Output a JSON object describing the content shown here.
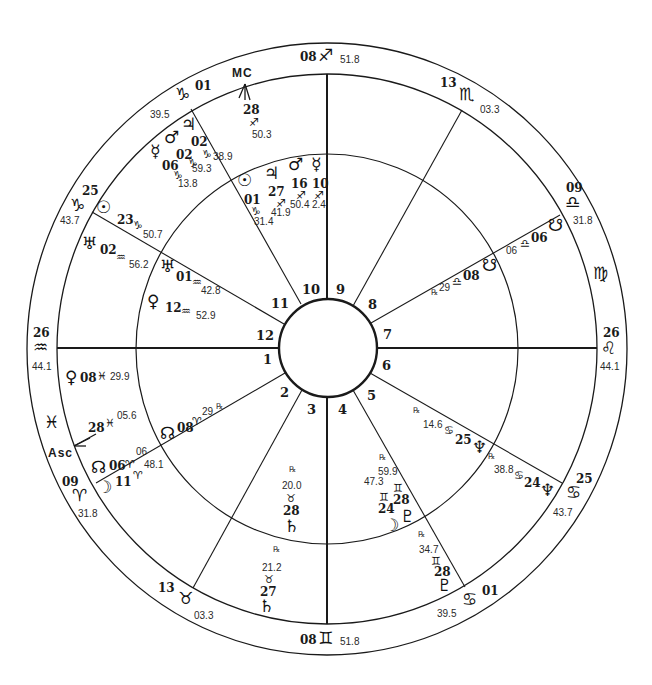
{
  "chart": {
    "type": "natal-astrology-wheel",
    "colors": {
      "ink": "#1a1a1a",
      "background": "#ffffff"
    },
    "angles": {
      "mc_label": "MC",
      "asc_label": "Asc"
    },
    "house_numbers": [
      "1",
      "2",
      "3",
      "4",
      "5",
      "6",
      "7",
      "8",
      "9",
      "10",
      "11",
      "12"
    ],
    "cusps": [
      {
        "id": "cusp-10-top",
        "deg": "08",
        "sign": "sagittarius",
        "glyph": "♐",
        "min": "51.8"
      },
      {
        "id": "cusp-11",
        "deg": "01",
        "sign": "capricorn",
        "glyph": "♑",
        "min": "39.5"
      },
      {
        "id": "cusp-12",
        "deg": "25",
        "sign": "capricorn",
        "glyph": "♑",
        "min": "43.7"
      },
      {
        "id": "cusp-1",
        "deg": "26",
        "sign": "aquarius",
        "glyph": "♒",
        "min": "44.1"
      },
      {
        "id": "cusp-2",
        "deg": "09",
        "sign": "aries",
        "glyph": "♈",
        "min": "31.8"
      },
      {
        "id": "cusp-3",
        "deg": "13",
        "sign": "taurus",
        "glyph": "♉",
        "min": "03.3"
      },
      {
        "id": "cusp-4",
        "deg": "08",
        "sign": "gemini",
        "glyph": "♊",
        "min": "51.8"
      },
      {
        "id": "cusp-5",
        "deg": "01",
        "sign": "cancer",
        "glyph": "♋",
        "min": "39.5"
      },
      {
        "id": "cusp-6",
        "deg": "25",
        "sign": "cancer",
        "glyph": "♋",
        "min": "43.7"
      },
      {
        "id": "cusp-7",
        "deg": "26",
        "sign": "leo",
        "glyph": "♌",
        "min": "44.1"
      },
      {
        "id": "cusp-8",
        "deg": "09",
        "sign": "libra",
        "glyph": "♎",
        "min": "31.8"
      },
      {
        "id": "cusp-9",
        "deg": "13",
        "sign": "scorpio",
        "glyph": "♏",
        "min": "03.3"
      }
    ],
    "intercepted_signs": [
      {
        "sign": "pisces",
        "glyph": "♓"
      },
      {
        "sign": "virgo",
        "glyph": "♍"
      }
    ],
    "outer_ring_planets": [
      {
        "name": "jupiter",
        "glyph": "♃",
        "deg": "02",
        "sign_glyph": "♑",
        "min": "38.9"
      },
      {
        "name": "mars",
        "glyph": "♂",
        "deg": "02",
        "sign_glyph": "♑",
        "min": "59.3"
      },
      {
        "name": "mercury",
        "glyph": "☿",
        "deg": "06",
        "sign_glyph": "♑",
        "min": "13.8"
      },
      {
        "name": "sun",
        "glyph": "☉",
        "deg": "23",
        "sign_glyph": "♑",
        "min": "50.7"
      },
      {
        "name": "uranus",
        "glyph": "♅",
        "deg": "02",
        "sign_glyph": "♒",
        "min": "56.2"
      },
      {
        "name": "venus",
        "glyph": "♀",
        "deg": "08",
        "sign_glyph": "♓",
        "min": "29.9"
      },
      {
        "name": "asc",
        "glyph": "Asc",
        "deg": "28",
        "sign_glyph": "♓",
        "min": "05.6"
      },
      {
        "name": "north-node",
        "glyph": "☊",
        "deg": "06",
        "sign_glyph": "♈",
        "min": "06"
      },
      {
        "name": "moon",
        "glyph": "☽",
        "deg": "11",
        "sign_glyph": "♈",
        "min": "48.1"
      },
      {
        "name": "mc",
        "glyph": "MC",
        "deg": "28",
        "sign_glyph": "♐",
        "min": "50.3"
      },
      {
        "name": "south-node",
        "glyph": "☋",
        "deg": "06",
        "sign_glyph": "♎",
        "min": "06"
      },
      {
        "name": "neptune",
        "glyph": "♆",
        "deg": "24",
        "sign_glyph": "♋",
        "min": "38.8",
        "retro": "℞"
      },
      {
        "name": "pluto",
        "glyph": "♇",
        "deg": "28",
        "sign_glyph": "♊",
        "min": "34.7",
        "retro": "℞"
      },
      {
        "name": "saturn",
        "glyph": "♄",
        "deg": "27",
        "sign_glyph": "♉",
        "min": "21.2",
        "retro": "℞"
      }
    ],
    "inner_ring_planets": [
      {
        "name": "sun",
        "glyph": "☉",
        "deg": "01",
        "sign_glyph": "♑",
        "min": "31.4"
      },
      {
        "name": "jupiter",
        "glyph": "♃",
        "deg": "27",
        "sign_glyph": "♐",
        "min": "41.9"
      },
      {
        "name": "mars",
        "glyph": "♂",
        "deg": "16",
        "sign_glyph": "♐",
        "min": "50.4"
      },
      {
        "name": "mercury",
        "glyph": "☿",
        "deg": "10",
        "sign_glyph": "♐",
        "min": "2.4"
      },
      {
        "name": "uranus",
        "glyph": "♅",
        "deg": "01",
        "sign_glyph": "♒",
        "min": "42.8"
      },
      {
        "name": "venus",
        "glyph": "♀",
        "deg": "12",
        "sign_glyph": "♒",
        "min": "52.9"
      },
      {
        "name": "north-node",
        "glyph": "☊",
        "deg": "08",
        "sign_glyph": "♈",
        "min": "29",
        "retro": "℞"
      },
      {
        "name": "south-node",
        "glyph": "☋",
        "deg": "08",
        "sign_glyph": "♎",
        "min": "29",
        "retro": "℞"
      },
      {
        "name": "neptune",
        "glyph": "♆",
        "deg": "25",
        "sign_glyph": "♋",
        "min": "14.6",
        "retro": "℞"
      },
      {
        "name": "pluto",
        "glyph": "♇",
        "deg": "28",
        "sign_glyph": "♊",
        "min": "59.9",
        "retro": "℞"
      },
      {
        "name": "moon",
        "glyph": "☽",
        "deg": "24",
        "sign_glyph": "♊",
        "min": "47.3"
      },
      {
        "name": "saturn",
        "glyph": "♄",
        "deg": "28",
        "sign_glyph": "♉",
        "min": "20.0",
        "retro": "℞"
      }
    ]
  },
  "labels": {
    "top_deg": "08",
    "top_glyph": "♐",
    "top_min": "51.8",
    "bottom_deg": "08",
    "bottom_glyph": "♊",
    "bottom_min": "51.8",
    "left_deg": "26",
    "left_glyph": "♒",
    "left_min": "44.1",
    "right_deg": "26",
    "right_glyph": "♌",
    "right_min": "44.1",
    "cap01_deg": "01",
    "cap01_glyph": "♑",
    "cap01_min": "39.5",
    "cap25_deg": "25",
    "cap25_glyph": "♑",
    "cap25_min": "43.7",
    "ari09_deg": "09",
    "ari09_glyph": "♈",
    "ari09_min": "31.8",
    "tau13_deg": "13",
    "tau13_glyph": "♉",
    "tau13_min": "03.3",
    "can01_deg": "01",
    "can01_glyph": "♋",
    "can01_min": "39.5",
    "can25_deg": "25",
    "can25_glyph": "♋",
    "can25_min": "43.7",
    "lib09_deg": "09",
    "lib09_glyph": "♎",
    "lib09_min": "31.8",
    "sco13_deg": "13",
    "sco13_glyph": "♏",
    "sco13_min": "03.3",
    "pisces_glyph": "♓",
    "virgo_glyph": "♍",
    "mc": "MC",
    "asc": "Asc",
    "rx": "℞",
    "h1": "1",
    "h2": "2",
    "h3": "3",
    "h4": "4",
    "h5": "5",
    "h6": "6",
    "h7": "7",
    "h8": "8",
    "h9": "9",
    "h10": "10",
    "h11": "11",
    "h12": "12",
    "mc_deg": "28",
    "mc_sign": "♐",
    "mc_min": "50.3",
    "o_jup_g": "♃",
    "o_mars_g": "♂",
    "o_merc_g": "☿",
    "o_jup_deg": "02",
    "o_jup_sign": "♑",
    "o_jup_min": "38.9",
    "o_mars_deg": "02",
    "o_mars_sign": "♑",
    "o_mars_min": "59.3",
    "o_merc_deg": "06",
    "o_merc_sign": "♑",
    "o_merc_min": "13.8",
    "o_sun_g": "☉",
    "o_sun_deg": "23",
    "o_sun_sign": "♑",
    "o_sun_min": "50.7",
    "o_ura_g": "♅",
    "o_ura_deg": "02",
    "o_ura_sign": "♒",
    "o_ura_min": "56.2",
    "o_ven_g": "♀",
    "o_ven_deg": "08",
    "o_ven_sign": "♓",
    "o_ven_min": "29.9",
    "asc_deg": "28",
    "asc_sign": "♓",
    "asc_min": "05.6",
    "o_nn_g": "☊",
    "o_nn_deg": "06",
    "o_nn_sign": "♈",
    "o_nn_min": "06",
    "o_moon_g": "☽",
    "o_moon_deg": "11",
    "o_moon_sign": "♈",
    "o_moon_min": "48.1",
    "i_sun_g": "☉",
    "i_sun_deg": "01",
    "i_sun_sign": "♑",
    "i_sun_min": "31.4",
    "i_jup_g": "♃",
    "i_jup_deg": "27",
    "i_jup_sign": "♐",
    "i_jup_min": "41.9",
    "i_mars_g": "♂",
    "i_mars_deg": "16",
    "i_mars_sign": "♐",
    "i_mars_min": "50.4",
    "i_merc_g": "☿",
    "i_merc_deg": "10",
    "i_merc_sign": "♐",
    "i_merc_min": "2.4",
    "i_ura_g": "♅",
    "i_ura_deg": "01",
    "i_ura_sign": "♒",
    "i_ura_min": "42.8",
    "i_ven_g": "♀",
    "i_ven_deg": "12",
    "i_ven_sign": "♒",
    "i_ven_min": "52.9",
    "i_nn_g": "☊",
    "i_nn_deg": "08",
    "i_nn_sign": "♈",
    "i_nn_min": "29",
    "o_sn_g": "☋",
    "o_sn_deg": "06",
    "o_sn_sign": "♎",
    "o_sn_min": "06",
    "i_sn_g": "☋",
    "i_sn_deg": "08",
    "i_sn_sign": "♎",
    "i_sn_min": "29",
    "i_nep_g": "♆",
    "i_nep_deg": "25",
    "i_nep_sign": "♋",
    "i_nep_min": "14.6",
    "o_nep_g": "♆",
    "o_nep_deg": "24",
    "o_nep_sign": "♋",
    "o_nep_min": "38.8",
    "i_plu_g": "♇",
    "i_plu_deg": "28",
    "i_plu_sign": "♊",
    "i_plu_min": "59.9",
    "i_moon_g": "☽",
    "i_moon_deg": "24",
    "i_moon_sign": "♊",
    "i_moon_min": "47.3",
    "o_plu_g": "♇",
    "o_plu_deg": "28",
    "o_plu_sign": "♊",
    "o_plu_min": "34.7",
    "i_sat_g": "♄",
    "i_sat_deg": "28",
    "i_sat_sign": "♉",
    "i_sat_min": "20.0",
    "o_sat_g": "♄",
    "o_sat_deg": "27",
    "o_sat_sign": "♉",
    "o_sat_min": "21.2"
  }
}
